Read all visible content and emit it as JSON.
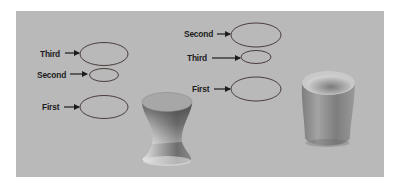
{
  "colors": {
    "background": "#ffffff",
    "panel": "#b9b9b9",
    "outline": "#4a3c3c",
    "text": "#1c1c1c"
  },
  "left_group": {
    "labels": [
      {
        "text": "Third",
        "order": 3
      },
      {
        "text": "Second",
        "order": 2
      },
      {
        "text": "First",
        "order": 1
      }
    ],
    "object": "hourglass-loft-shape"
  },
  "right_group": {
    "labels": [
      {
        "text": "Second",
        "order": 2
      },
      {
        "text": "Third",
        "order": 3
      },
      {
        "text": "First",
        "order": 1
      }
    ],
    "object": "cup-loft-shape"
  }
}
